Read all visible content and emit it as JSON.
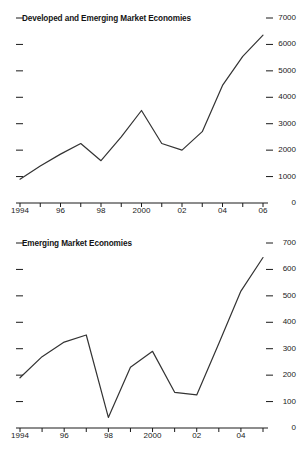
{
  "figure": {
    "background_color": "#ffffff",
    "line_color": "#333333",
    "axis_color": "#1a1a1a"
  },
  "charts": [
    {
      "id": "developed-and-emerging",
      "title": "Developed and Emerging Market Economies",
      "y_ticks": [
        "7000",
        "6000",
        "5000",
        "4000",
        "3000",
        "2000",
        "1000",
        "0"
      ],
      "x_ticks": [
        "1994",
        "96",
        "98",
        "2000",
        "02",
        "04",
        "06"
      ]
    },
    {
      "id": "emerging",
      "title": "Emerging Market Economies",
      "y_ticks": [
        "700",
        "600",
        "500",
        "400",
        "300",
        "200",
        "100",
        "0"
      ],
      "x_ticks": [
        "1994",
        "96",
        "98",
        "2000",
        "02",
        "04"
      ]
    }
  ],
  "chart_data": [
    {
      "type": "line",
      "title": "Developed and Emerging Market Economies",
      "xlabel": "",
      "ylabel": "",
      "x": [
        1994,
        1995,
        1996,
        1997,
        1998,
        1999,
        2000,
        2001,
        2002,
        2003,
        2004,
        2005,
        2006
      ],
      "categories": [
        "1994",
        "1995",
        "1996",
        "1997",
        "1998",
        "1999",
        "2000",
        "2001",
        "2002",
        "2003",
        "2004",
        "2005",
        "2006"
      ],
      "values": [
        900,
        1400,
        1850,
        2250,
        1600,
        2500,
        3500,
        2250,
        2000,
        2700,
        4450,
        5550,
        6350
      ],
      "xlim": [
        1994,
        2006
      ],
      "ylim": [
        0,
        7000
      ],
      "yticks": [
        0,
        1000,
        2000,
        3000,
        4000,
        5000,
        6000,
        7000
      ],
      "xticks_labeled": [
        1994,
        1996,
        1998,
        2000,
        2002,
        2004,
        2006
      ],
      "grid": false,
      "legend": false,
      "y_axis_position": "right"
    },
    {
      "type": "line",
      "title": "Emerging Market Economies",
      "xlabel": "",
      "ylabel": "",
      "x": [
        1994,
        1995,
        1996,
        1997,
        1998,
        1999,
        2000,
        2001,
        2002,
        2003,
        2004,
        2005
      ],
      "categories": [
        "1994",
        "1995",
        "1996",
        "1997",
        "1998",
        "1999",
        "2000",
        "2001",
        "2002",
        "2003",
        "2004",
        "2005"
      ],
      "values": [
        190,
        270,
        325,
        352,
        40,
        230,
        290,
        135,
        125,
        320,
        518,
        645
      ],
      "xlim": [
        1994,
        2005
      ],
      "ylim": [
        0,
        700
      ],
      "yticks": [
        0,
        100,
        200,
        300,
        400,
        500,
        600,
        700
      ],
      "xticks_labeled": [
        1994,
        1996,
        1998,
        2000,
        2002,
        2004
      ],
      "grid": false,
      "legend": false,
      "y_axis_position": "right"
    }
  ]
}
